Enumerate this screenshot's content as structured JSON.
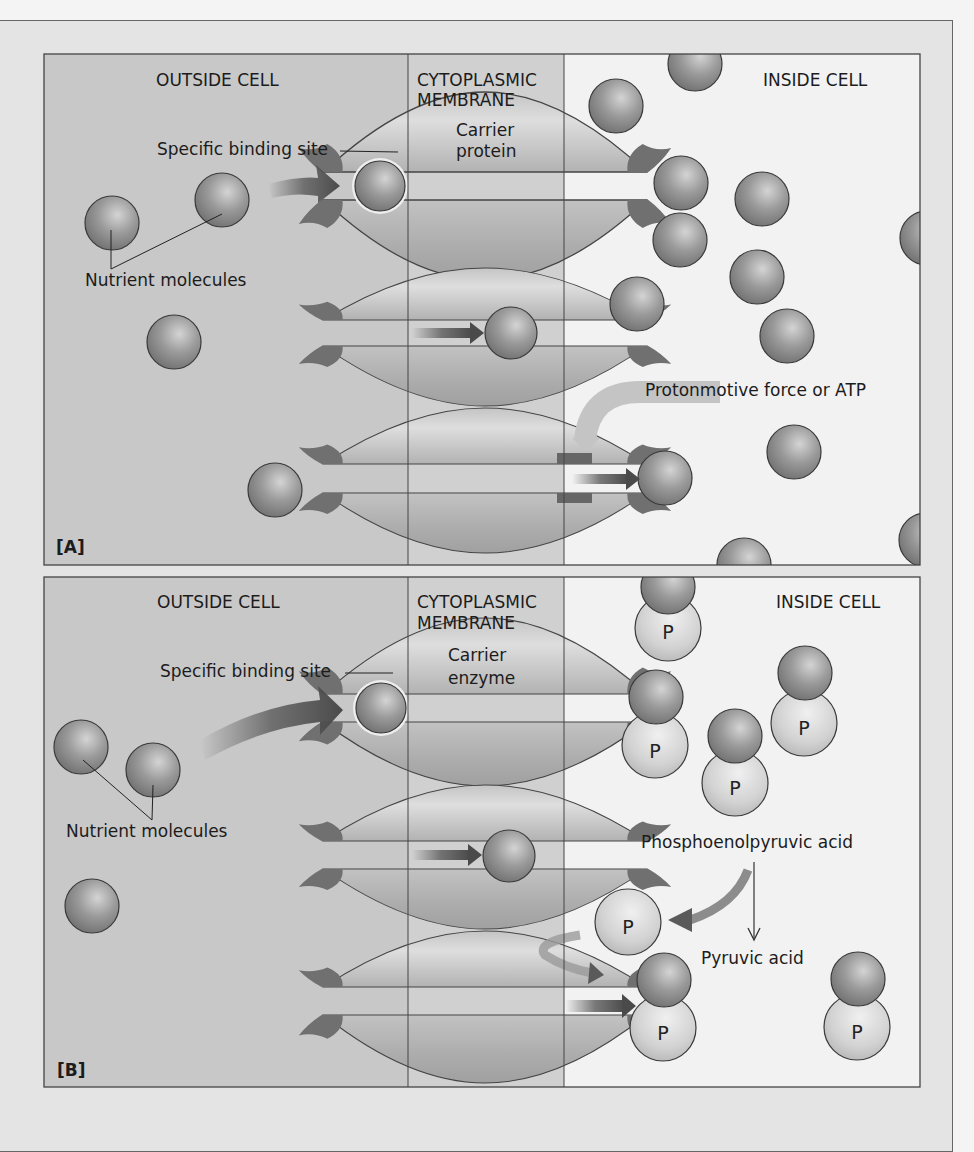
{
  "figure": {
    "panels": [
      {
        "id": "A",
        "label": "[A]",
        "regions": {
          "outside": "OUTSIDE CELL",
          "membrane_line1": "CYTOPLASMIC",
          "membrane_line2": "MEMBRANE",
          "inside": "INSIDE CELL"
        },
        "carrier_line1": "Carrier",
        "carrier_line2": "protein",
        "binding_site_label": "Specific binding site",
        "nutrient_label": "Nutrient molecules",
        "energy_label": "Protonmotive force or ATP"
      },
      {
        "id": "B",
        "label": "[B]",
        "regions": {
          "outside": "OUTSIDE CELL",
          "membrane_line1": "CYTOPLASMIC",
          "membrane_line2": "MEMBRANE",
          "inside": "INSIDE CELL"
        },
        "carrier_line1": "Carrier",
        "carrier_line2": "enzyme",
        "binding_site_label": "Specific binding site",
        "nutrient_label": "Nutrient molecules",
        "pep_label": "Phosphoenolpyruvic acid",
        "pyruvate_label": "Pyruvic acid",
        "phosphate_symbol": "P"
      }
    ],
    "colors": {
      "outside_bg": "#c8c8c8",
      "membrane_bg": "#d2d2d2",
      "inside_bg": "#f2f2f2",
      "carrier": "#b8b8b8",
      "binding_site": "#707070",
      "nutrient": "#8e8e8e",
      "phosphate": "#d6d6d6",
      "arrow": "#5a5a5a"
    }
  }
}
